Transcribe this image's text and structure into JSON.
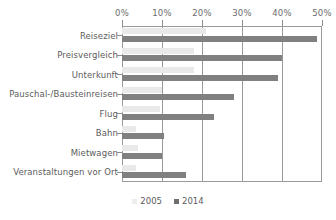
{
  "chart_data": {
    "type": "bar",
    "orientation": "horizontal",
    "title": "",
    "xlabel": "",
    "ylabel": "",
    "xlim": [
      0,
      50
    ],
    "grid": true,
    "legend_position": "bottom",
    "xticks": [
      "0%",
      "10%",
      "20%",
      "30%",
      "40%",
      "50%"
    ],
    "xtick_values": [
      0,
      10,
      20,
      30,
      40,
      50
    ],
    "categories": [
      "Reiseziel",
      "Preisvergleich",
      "Unterkunft",
      "Pauschal-/Bausteinreisen",
      "Flug",
      "Bahn",
      "Mietwagen",
      "Veranstaltungen vor Ort"
    ],
    "series": [
      {
        "name": "2005",
        "color": "#e9e9e9",
        "values": [
          21,
          18,
          18,
          10,
          9.5,
          3.5,
          4,
          3.5
        ]
      },
      {
        "name": "2014",
        "color": "#808080",
        "values": [
          48.8,
          40,
          39,
          28,
          23,
          10.5,
          10,
          16
        ]
      }
    ]
  },
  "legend": {
    "items": [
      {
        "label": "2005",
        "icon": "legend-swatch-2005"
      },
      {
        "label": "2014",
        "icon": "legend-swatch-2014"
      }
    ]
  }
}
